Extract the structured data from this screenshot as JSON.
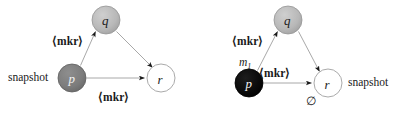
{
  "figure": {
    "caption": "",
    "background_color": "#ffffff",
    "panels": [
      {
        "id": "left-panel",
        "name": "snapshot-marker-diagram-before",
        "nodes": [
          {
            "id": "q",
            "label": "q",
            "fill": "#b4b4b4",
            "stroke": "#8c8c8c",
            "text_color": "#1c1c1c",
            "cx": 106,
            "cy": 20,
            "r": 14
          },
          {
            "id": "p",
            "label": "p",
            "fill": "#7a7a7a",
            "stroke": "#5e5e5e",
            "text_color": "#f2f2f2",
            "cx": 72,
            "cy": 78,
            "r": 14
          },
          {
            "id": "r",
            "label": "r",
            "fill": "#ffffff",
            "stroke": "#9a9a9a",
            "text_color": "#1c1c1c",
            "cx": 161,
            "cy": 78,
            "r": 14
          }
        ],
        "edges": [
          {
            "id": "p-to-q",
            "from": "p",
            "to": "q",
            "label": "⟨mkr⟩"
          },
          {
            "id": "q-to-r",
            "from": "q",
            "to": "r",
            "label": ""
          },
          {
            "id": "p-to-r",
            "from": "p",
            "to": "r",
            "label": "⟨mkr⟩"
          }
        ],
        "annotations": [
          {
            "id": "snapshot-left",
            "text": "snapshot",
            "x": 8,
            "y": 72
          },
          {
            "id": "mkr-upper-left",
            "text": "⟨mkr⟩",
            "x": 52,
            "y": 36
          },
          {
            "id": "mkr-lower-left",
            "text": "⟨mkr⟩",
            "x": 98,
            "y": 92
          }
        ]
      },
      {
        "id": "right-panel",
        "name": "snapshot-marker-diagram-after",
        "nodes": [
          {
            "id": "q2",
            "label": "q",
            "fill": "#b4b4b4",
            "stroke": "#8c8c8c",
            "text_color": "#1c1c1c",
            "cx": 288,
            "cy": 20,
            "r": 14
          },
          {
            "id": "p2",
            "label": "p",
            "fill": "#0a0a0a",
            "stroke": "#000000",
            "text_color": "#ffffff",
            "cx": 249,
            "cy": 83,
            "r": 14
          },
          {
            "id": "r2",
            "label": "r",
            "fill": "#ffffff",
            "stroke": "#9a9a9a",
            "text_color": "#1c1c1c",
            "cx": 328,
            "cy": 83,
            "r": 14
          }
        ],
        "edges": [
          {
            "id": "p2-to-q2",
            "from": "p2",
            "to": "q2",
            "label": "⟨mkr⟩"
          },
          {
            "id": "q2-to-r2",
            "from": "q2",
            "to": "r2",
            "label": ""
          },
          {
            "id": "p2-to-r2",
            "from": "p2",
            "to": "r2",
            "label": "⟨mkr⟩"
          }
        ],
        "annotations": [
          {
            "id": "mkr-upper-right",
            "text": "⟨mkr⟩",
            "x": 232,
            "y": 36
          },
          {
            "id": "message-m1",
            "text": "m",
            "subscript": "1",
            "x": 239,
            "y": 58
          },
          {
            "id": "mkr-middle-right",
            "text": "⟨mkr⟩",
            "x": 259,
            "y": 68
          },
          {
            "id": "empty-set",
            "text": "∅",
            "x": 307,
            "y": 96
          },
          {
            "id": "snapshot-right",
            "text": "snapshot",
            "x": 348,
            "y": 77
          }
        ]
      }
    ]
  }
}
